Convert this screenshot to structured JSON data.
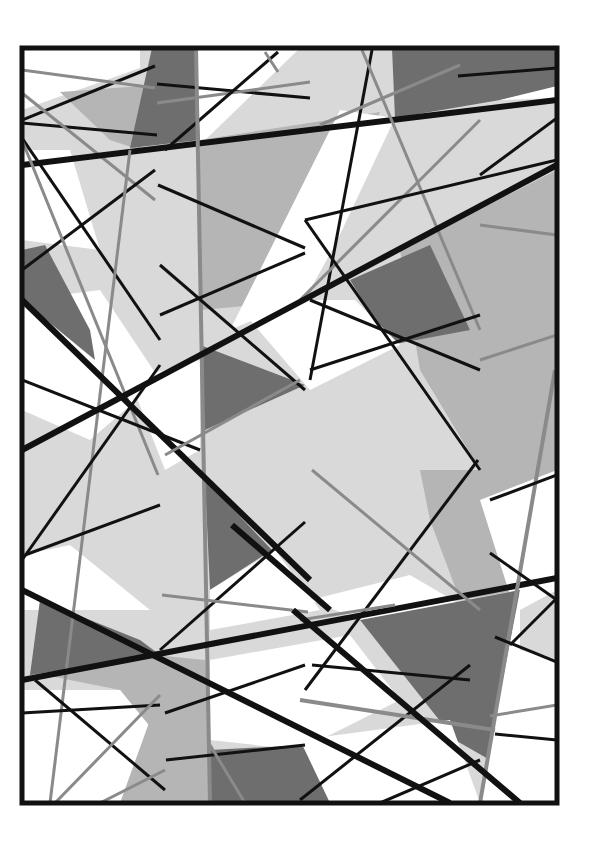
{
  "artwork": {
    "description": "Abstract geometric composition of overlapping grayscale polygons crossed by black and gray lines, inside a black frame",
    "colors": {
      "background": "#ffffff",
      "frame": "#111111",
      "light_gray": "#d9d9d9",
      "mid_gray": "#b5b5b5",
      "dark_gray": "#6e6e6e",
      "line_black": "#111111",
      "line_gray": "#8a8a8a"
    },
    "frame": {
      "x": 22,
      "y": 48,
      "width": 535,
      "height": 755,
      "stroke": 5
    },
    "polygons": [
      {
        "fill": "light_gray",
        "points": "22,48 557,48 557,803 22,803"
      },
      {
        "fill": "white",
        "points": "22,48 140,48 140,68 22,110"
      },
      {
        "fill": "white",
        "points": "196,48 300,48 200,145 196,145"
      },
      {
        "fill": "mid_gray",
        "points": "60,92 155,85 140,150 110,140"
      },
      {
        "fill": "dark_gray",
        "points": "152,48 196,48 200,140 130,148"
      },
      {
        "fill": "dark_gray",
        "points": "392,48 557,48 557,88 500,100 395,118"
      },
      {
        "fill": "white",
        "points": "500,100 557,86 557,98"
      },
      {
        "fill": "mid_gray",
        "points": "200,140 380,112 320,250 310,300 200,310"
      },
      {
        "fill": "white",
        "points": "22,150 70,150 100,250 22,240"
      },
      {
        "fill": "white",
        "points": "340,110 395,118 335,245 310,290 300,300 230,330"
      },
      {
        "fill": "white",
        "points": "22,300 100,290 160,380 90,440 22,410"
      },
      {
        "fill": "dark_gray",
        "points": "22,250 45,245 90,330 95,360 22,300"
      },
      {
        "fill": "mid_gray",
        "points": "400,250 557,170 557,480 480,470 420,370"
      },
      {
        "fill": "dark_gray",
        "points": "350,280 430,245 470,330 390,345"
      },
      {
        "fill": "white",
        "points": "250,320 300,300 355,300 400,345 310,390"
      },
      {
        "fill": "white",
        "points": "130,380 200,360 200,450 165,470"
      },
      {
        "fill": "dark_gray",
        "points": "200,345 305,385 205,430"
      },
      {
        "fill": "dark_gray",
        "points": "205,480 272,550 210,590"
      },
      {
        "fill": "white",
        "points": "210,590 275,550 320,610 210,630"
      },
      {
        "fill": "mid_gray",
        "points": "420,470 557,470 557,580 520,590 460,600 430,520"
      },
      {
        "fill": "white",
        "points": "480,500 557,470 557,590 510,595"
      },
      {
        "fill": "white",
        "points": "22,555 70,545 150,610 22,610"
      },
      {
        "fill": "dark_gray",
        "points": "40,600 140,640 160,655 30,675"
      },
      {
        "fill": "white",
        "points": "310,600 410,575 470,610 360,620"
      },
      {
        "fill": "dark_gray",
        "points": "360,620 520,590 505,700 490,760 455,740"
      },
      {
        "fill": "white",
        "points": "520,590 557,580 557,803 480,803 495,720"
      },
      {
        "fill": "mid_gray",
        "points": "45,675 155,655 205,660 210,730 165,745 120,690"
      },
      {
        "fill": "white",
        "points": "22,690 120,690 165,745 155,803 22,803"
      },
      {
        "fill": "white",
        "points": "210,660 350,635 400,700 300,750 210,740"
      },
      {
        "fill": "mid_gray",
        "points": "150,720 210,700 210,803 120,803"
      },
      {
        "fill": "dark_gray",
        "points": "210,750 305,745 330,780 335,803 210,803"
      },
      {
        "fill": "white",
        "points": "300,740 450,720 480,803 330,803"
      },
      {
        "fill": "light_gray",
        "points": "520,610 557,590 557,660 520,650"
      }
    ],
    "lines": [
      {
        "color": "line_black",
        "w": 3,
        "x1": 22,
        "y1": 120,
        "x2": 155,
        "y2": 66
      },
      {
        "color": "line_gray",
        "w": 3,
        "x1": 22,
        "y1": 70,
        "x2": 155,
        "y2": 88
      },
      {
        "color": "line_black",
        "w": 3,
        "x1": 157,
        "y1": 84,
        "x2": 310,
        "y2": 98
      },
      {
        "color": "line_gray",
        "w": 3,
        "x1": 157,
        "y1": 103,
        "x2": 310,
        "y2": 82
      },
      {
        "color": "line_black",
        "w": 3,
        "x1": 22,
        "y1": 123,
        "x2": 157,
        "y2": 135
      },
      {
        "color": "line_gray",
        "w": 3,
        "x1": 22,
        "y1": 93,
        "x2": 155,
        "y2": 200
      },
      {
        "color": "line_black",
        "w": 6,
        "x1": 22,
        "y1": 165,
        "x2": 557,
        "y2": 100
      },
      {
        "color": "line_black",
        "w": 3,
        "x1": 165,
        "y1": 150,
        "x2": 278,
        "y2": 52
      },
      {
        "color": "line_gray",
        "w": 3,
        "x1": 265,
        "y1": 52,
        "x2": 278,
        "y2": 72
      },
      {
        "color": "line_gray",
        "w": 4,
        "x1": 196,
        "y1": 48,
        "x2": 210,
        "y2": 803
      },
      {
        "color": "line_black",
        "w": 3,
        "x1": 372,
        "y1": 50,
        "x2": 310,
        "y2": 380
      },
      {
        "color": "line_gray",
        "w": 3,
        "x1": 362,
        "y1": 50,
        "x2": 480,
        "y2": 330
      },
      {
        "color": "line_gray",
        "w": 3,
        "x1": 300,
        "y1": 300,
        "x2": 480,
        "y2": 120
      },
      {
        "color": "line_gray",
        "w": 3,
        "x1": 320,
        "y1": 125,
        "x2": 460,
        "y2": 65
      },
      {
        "color": "line_black",
        "w": 3,
        "x1": 458,
        "y1": 76,
        "x2": 557,
        "y2": 68
      },
      {
        "color": "line_black",
        "w": 3,
        "x1": 480,
        "y1": 175,
        "x2": 557,
        "y2": 118
      },
      {
        "color": "line_black",
        "w": 3,
        "x1": 22,
        "y1": 138,
        "x2": 160,
        "y2": 340
      },
      {
        "color": "line_black",
        "w": 3,
        "x1": 22,
        "y1": 270,
        "x2": 155,
        "y2": 170
      },
      {
        "color": "line_gray",
        "w": 3,
        "x1": 22,
        "y1": 140,
        "x2": 158,
        "y2": 475
      },
      {
        "color": "line_gray",
        "w": 3,
        "x1": 130,
        "y1": 150,
        "x2": 50,
        "y2": 803
      },
      {
        "color": "line_black",
        "w": 3,
        "x1": 158,
        "y1": 185,
        "x2": 305,
        "y2": 248
      },
      {
        "color": "line_black",
        "w": 3,
        "x1": 160,
        "y1": 315,
        "x2": 305,
        "y2": 253
      },
      {
        "color": "line_black",
        "w": 3,
        "x1": 160,
        "y1": 265,
        "x2": 305,
        "y2": 390
      },
      {
        "color": "line_black",
        "w": 3,
        "x1": 305,
        "y1": 220,
        "x2": 557,
        "y2": 160
      },
      {
        "color": "line_black",
        "w": 6,
        "x1": 22,
        "y1": 450,
        "x2": 557,
        "y2": 165
      },
      {
        "color": "line_black",
        "w": 3,
        "x1": 305,
        "y1": 220,
        "x2": 480,
        "y2": 470
      },
      {
        "color": "line_black",
        "w": 3,
        "x1": 310,
        "y1": 300,
        "x2": 480,
        "y2": 370
      },
      {
        "color": "line_black",
        "w": 3,
        "x1": 310,
        "y1": 370,
        "x2": 480,
        "y2": 315
      },
      {
        "color": "line_gray",
        "w": 3,
        "x1": 480,
        "y1": 360,
        "x2": 557,
        "y2": 335
      },
      {
        "color": "line_gray",
        "w": 3,
        "x1": 480,
        "y1": 225,
        "x2": 557,
        "y2": 235
      },
      {
        "color": "line_black",
        "w": 6,
        "x1": 22,
        "y1": 300,
        "x2": 310,
        "y2": 580
      },
      {
        "color": "line_black",
        "w": 3,
        "x1": 22,
        "y1": 380,
        "x2": 200,
        "y2": 450
      },
      {
        "color": "line_gray",
        "w": 3,
        "x1": 165,
        "y1": 455,
        "x2": 300,
        "y2": 380
      },
      {
        "color": "line_black",
        "w": 3,
        "x1": 22,
        "y1": 560,
        "x2": 160,
        "y2": 365
      },
      {
        "color": "line_black",
        "w": 3,
        "x1": 25,
        "y1": 555,
        "x2": 160,
        "y2": 505
      },
      {
        "color": "line_black",
        "w": 3,
        "x1": 160,
        "y1": 650,
        "x2": 305,
        "y2": 522
      },
      {
        "color": "line_black",
        "w": 6,
        "x1": 232,
        "y1": 525,
        "x2": 330,
        "y2": 610
      },
      {
        "color": "line_gray",
        "w": 3,
        "x1": 162,
        "y1": 595,
        "x2": 308,
        "y2": 612
      },
      {
        "color": "line_black",
        "w": 6,
        "x1": 22,
        "y1": 680,
        "x2": 557,
        "y2": 578
      },
      {
        "color": "line_black",
        "w": 6,
        "x1": 22,
        "y1": 590,
        "x2": 450,
        "y2": 803
      },
      {
        "color": "line_black",
        "w": 3,
        "x1": 305,
        "y1": 690,
        "x2": 478,
        "y2": 460
      },
      {
        "color": "line_gray",
        "w": 3,
        "x1": 312,
        "y1": 470,
        "x2": 480,
        "y2": 610
      },
      {
        "color": "line_gray",
        "w": 4,
        "x1": 555,
        "y1": 370,
        "x2": 480,
        "y2": 803
      },
      {
        "color": "line_black",
        "w": 3,
        "x1": 490,
        "y1": 500,
        "x2": 557,
        "y2": 475
      },
      {
        "color": "line_black",
        "w": 3,
        "x1": 490,
        "y1": 553,
        "x2": 557,
        "y2": 600
      },
      {
        "color": "line_black",
        "w": 3,
        "x1": 22,
        "y1": 713,
        "x2": 160,
        "y2": 705
      },
      {
        "color": "line_black",
        "w": 3,
        "x1": 35,
        "y1": 680,
        "x2": 165,
        "y2": 790
      },
      {
        "color": "line_gray",
        "w": 3,
        "x1": 55,
        "y1": 803,
        "x2": 160,
        "y2": 695
      },
      {
        "color": "line_gray",
        "w": 3,
        "x1": 100,
        "y1": 803,
        "x2": 165,
        "y2": 770
      },
      {
        "color": "line_black",
        "w": 3,
        "x1": 165,
        "y1": 713,
        "x2": 305,
        "y2": 665
      },
      {
        "color": "line_black",
        "w": 3,
        "x1": 166,
        "y1": 760,
        "x2": 305,
        "y2": 745
      },
      {
        "color": "line_gray",
        "w": 3,
        "x1": 300,
        "y1": 620,
        "x2": 395,
        "y2": 605
      },
      {
        "color": "line_black",
        "w": 3,
        "x1": 312,
        "y1": 665,
        "x2": 470,
        "y2": 680
      },
      {
        "color": "line_black",
        "w": 3,
        "x1": 300,
        "y1": 800,
        "x2": 470,
        "y2": 665
      },
      {
        "color": "line_gray",
        "w": 4,
        "x1": 300,
        "y1": 700,
        "x2": 495,
        "y2": 730
      },
      {
        "color": "line_black",
        "w": 6,
        "x1": 293,
        "y1": 610,
        "x2": 520,
        "y2": 803
      },
      {
        "color": "line_gray",
        "w": 3,
        "x1": 490,
        "y1": 716,
        "x2": 557,
        "y2": 705
      },
      {
        "color": "line_black",
        "w": 3,
        "x1": 495,
        "y1": 734,
        "x2": 557,
        "y2": 740
      },
      {
        "color": "line_black",
        "w": 3,
        "x1": 495,
        "y1": 637,
        "x2": 557,
        "y2": 662
      },
      {
        "color": "line_black",
        "w": 3,
        "x1": 510,
        "y1": 645,
        "x2": 557,
        "y2": 598
      },
      {
        "color": "line_black",
        "w": 3,
        "x1": 380,
        "y1": 803,
        "x2": 480,
        "y2": 760
      },
      {
        "color": "line_gray",
        "w": 3,
        "x1": 210,
        "y1": 745,
        "x2": 245,
        "y2": 803
      }
    ]
  }
}
